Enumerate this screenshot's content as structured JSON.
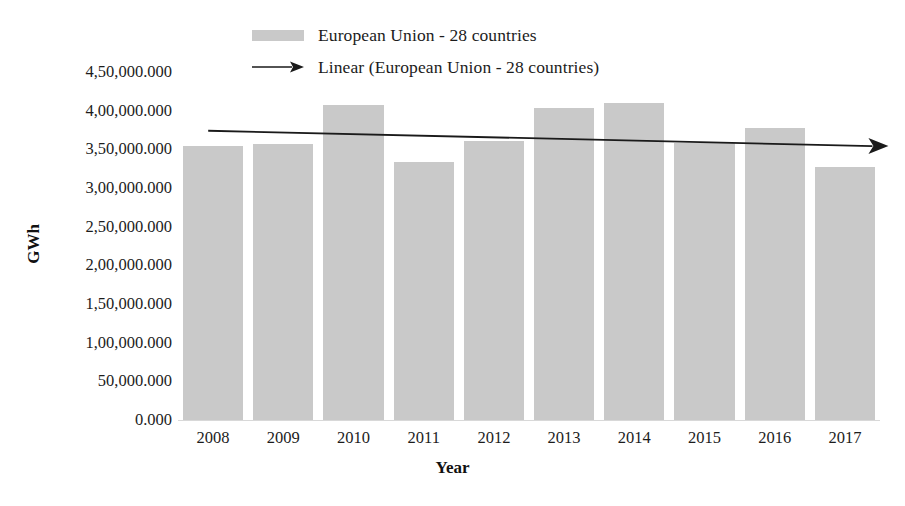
{
  "chart_data": {
    "type": "bar",
    "title": "",
    "xlabel": "Year",
    "ylabel": "GWh",
    "categories": [
      "2008",
      "2009",
      "2010",
      "2011",
      "2012",
      "2013",
      "2014",
      "2015",
      "2016",
      "2017"
    ],
    "series": [
      {
        "name": "European Union - 28 countries",
        "type": "bar",
        "color": "#c9c9c9",
        "values": [
          354000,
          357000,
          407000,
          334000,
          361000,
          403000,
          410000,
          358000,
          378000,
          327000
        ]
      },
      {
        "name": "Linear (European Union - 28 countries)",
        "type": "trendline",
        "color": "#1a1a1a",
        "values": [
          374000,
          371800,
          369600,
          367400,
          365200,
          363000,
          360800,
          358600,
          356400,
          354200
        ]
      }
    ],
    "ylim": [
      0,
      450000
    ],
    "ytick_values": [
      0,
      50000,
      100000,
      150000,
      200000,
      250000,
      300000,
      350000,
      400000,
      450000
    ],
    "ytick_labels": [
      "0.000",
      "50,000.000",
      "1,00,000.000",
      "1,50,000.000",
      "2,00,000.000",
      "2,50,000.000",
      "3,00,000.000",
      "3,50,000.000",
      "4,00,000.000",
      "4,50,000.000"
    ],
    "grid": false,
    "legend_position": "top-center"
  },
  "legend": {
    "series_label": "European Union - 28 countries",
    "trend_label": "Linear (European Union - 28 countries)",
    "swatch_color": "#c9c9c9",
    "trend_color": "#1a1a1a"
  },
  "axes": {
    "y_title": "GWh",
    "x_title": "Year"
  }
}
